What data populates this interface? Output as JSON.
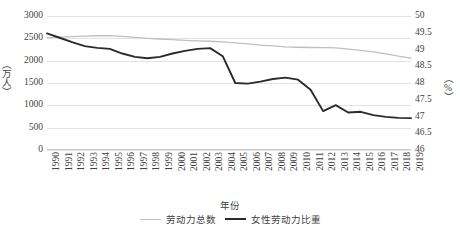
{
  "chart_data": {
    "type": "line",
    "title": "",
    "xlabel": "年份",
    "ylabel": "（万人）",
    "ylabel_secondary": "（%）",
    "grid": true,
    "legend_position": "bottom",
    "ylim": [
      0,
      3000
    ],
    "ylim_secondary": [
      46,
      50
    ],
    "yticks": [
      "0",
      "500",
      "1000",
      "1500",
      "2000",
      "2500",
      "3000"
    ],
    "yticks_secondary": [
      "46",
      "46.5",
      "47",
      "47.5",
      "48",
      "48.5",
      "49",
      "49.5",
      "50"
    ],
    "categories": [
      "1990",
      "1991",
      "1992",
      "1993",
      "1994",
      "1995",
      "1996",
      "1997",
      "1998",
      "1999",
      "2000",
      "2001",
      "2002",
      "2003",
      "2004",
      "2005",
      "2006",
      "2007",
      "2008",
      "2009",
      "2010",
      "2011",
      "2012",
      "2013",
      "2014",
      "2015",
      "2016",
      "2017",
      "2018",
      "2019"
    ],
    "series": [
      {
        "name": "劳动力总数",
        "axis": "left",
        "color": "#bfbfbf",
        "unit": "万人",
        "values": [
          2510,
          2525,
          2540,
          2550,
          2558,
          2562,
          2545,
          2520,
          2500,
          2485,
          2470,
          2455,
          2445,
          2435,
          2420,
          2400,
          2375,
          2350,
          2330,
          2310,
          2300,
          2295,
          2290,
          2285,
          2260,
          2230,
          2195,
          2150,
          2100,
          2055
        ]
      },
      {
        "name": "女性劳动力比重",
        "axis": "right",
        "color": "#2b2b2b",
        "unit": "%",
        "values": [
          49.48,
          49.35,
          49.22,
          49.1,
          49.05,
          49.02,
          48.88,
          48.78,
          48.74,
          48.78,
          48.88,
          48.96,
          49.02,
          49.04,
          48.8,
          48.0,
          47.98,
          48.04,
          48.12,
          48.16,
          48.1,
          47.8,
          47.16,
          47.34,
          47.12,
          47.14,
          47.04,
          46.99,
          46.96,
          46.95
        ]
      }
    ]
  },
  "legend": {
    "entries": [
      {
        "label": "劳动力总数"
      },
      {
        "label": "女性劳动力比重"
      }
    ]
  }
}
